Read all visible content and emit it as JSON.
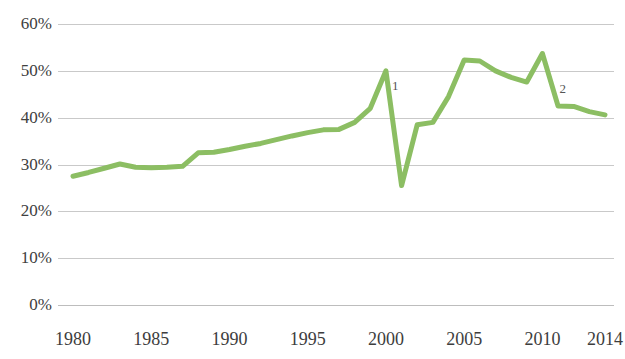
{
  "chart_data": {
    "type": "line",
    "title": "",
    "subtitle": "",
    "xlabel": "",
    "ylabel": "",
    "grid": true,
    "legend": "none",
    "xlim": [
      1980,
      2014
    ],
    "ylim": [
      0,
      60
    ],
    "y_tick_labels": [
      "60%",
      "50%",
      "40%",
      "30%",
      "20%",
      "10%",
      "0%"
    ],
    "y_tick_values": [
      60,
      50,
      40,
      30,
      20,
      10,
      0
    ],
    "x_tick_labels": [
      "1980",
      "1985",
      "1990",
      "1995",
      "2000",
      "2005",
      "2010",
      "2014"
    ],
    "x_tick_values": [
      1980,
      1985,
      1990,
      1995,
      2000,
      2005,
      2010,
      2014
    ],
    "series": [
      {
        "name": "Share",
        "color": "#8CBE63",
        "x": [
          1980,
          1981,
          1982,
          1983,
          1984,
          1985,
          1986,
          1987,
          1988,
          1989,
          1990,
          1991,
          1992,
          1993,
          1994,
          1995,
          1996,
          1997,
          1998,
          1999,
          2000,
          2001,
          2002,
          2003,
          2004,
          2005,
          2006,
          2007,
          2008,
          2009,
          2010,
          2011,
          2012,
          2013,
          2014
        ],
        "values": [
          27.5,
          28.3,
          29.2,
          30.1,
          29.4,
          29.3,
          29.4,
          29.6,
          32.5,
          32.6,
          33.2,
          33.9,
          34.5,
          35.3,
          36.1,
          36.8,
          37.4,
          37.5,
          39.0,
          42.0,
          50.0,
          25.5,
          38.5,
          39.0,
          44.5,
          52.3,
          52.1,
          50.0,
          48.6,
          47.6,
          53.7,
          42.5,
          42.4,
          41.3,
          40.6
        ]
      }
    ],
    "annotations": [
      {
        "label": "1",
        "x": 2000.6,
        "y": 47.0
      },
      {
        "label": "2",
        "x": 2011.3,
        "y": 46.4
      }
    ]
  },
  "style": {
    "line_color": "#8CBE63",
    "gridline_color": "#c9c9c9",
    "axis_text_color": "#3d3d3d",
    "background": "#ffffff"
  }
}
